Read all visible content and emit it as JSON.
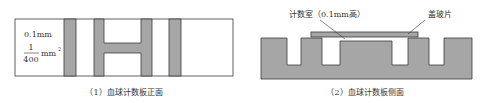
{
  "figure_front": {
    "caption": "（1）血球计数板正面",
    "label_depth": "0.1mm",
    "label_area_numerator": "1",
    "label_area_denominator": "400",
    "label_area_unit": "mm",
    "label_area_exp": "2"
  },
  "figure_side": {
    "caption": "（2）血球计数板侧面",
    "label_chamber": "计数室（0.1mm高）",
    "label_coverslip": "盖玻片"
  },
  "colors": {
    "fill_gray": "#a6a6a6",
    "stroke": "#3a3a3a",
    "background": "#ffffff"
  }
}
